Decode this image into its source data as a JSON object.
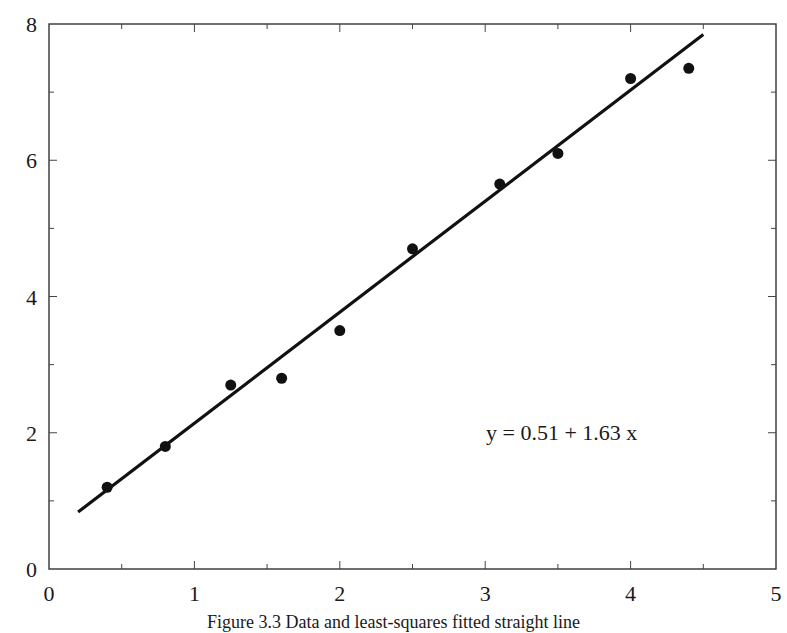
{
  "chart_data": {
    "type": "scatter",
    "title": "",
    "xlabel": "",
    "ylabel": "",
    "xlim": [
      0,
      5
    ],
    "ylim": [
      0,
      8
    ],
    "grid": false,
    "legend": null,
    "x_ticks": [
      0,
      1,
      2,
      3,
      4,
      5
    ],
    "x_tick_labels": [
      "0",
      "1",
      "2",
      "3",
      "4",
      "5"
    ],
    "x_minor_ticks": [
      0.5,
      1.5,
      2.5,
      3.5,
      4.5
    ],
    "y_ticks": [
      0,
      2,
      4,
      6,
      8
    ],
    "y_tick_labels": [
      "0",
      "2",
      "4",
      "6",
      "8"
    ],
    "y_minor_ticks": [
      1,
      3,
      5,
      7
    ],
    "series": [
      {
        "name": "data",
        "type": "scatter",
        "marker": "filled-circle",
        "color": "#111111",
        "x": [
          0.4,
          0.8,
          1.25,
          1.6,
          2.0,
          2.5,
          3.1,
          3.5,
          4.0,
          4.4
        ],
        "y": [
          1.2,
          1.8,
          2.7,
          2.8,
          3.5,
          4.7,
          5.65,
          6.1,
          7.2,
          7.35
        ]
      },
      {
        "name": "fit",
        "type": "line",
        "color": "#111111",
        "intercept": 0.51,
        "slope": 1.63,
        "x_range": [
          0.2,
          4.5
        ]
      }
    ],
    "annotations": [
      {
        "text": "y = 0.51 + 1.63 x",
        "x": 3.0,
        "y": 2.0
      }
    ]
  },
  "figure": {
    "equation_label": "y = 0.51 + 1.63 x",
    "caption": "Figure 3.3   Data and least-squares fitted straight line"
  }
}
